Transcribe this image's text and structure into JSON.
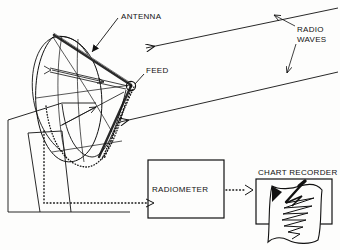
{
  "figure": {
    "type": "technical-diagram",
    "background_color": "#fdfdfc",
    "ink_color": "#111111"
  },
  "labels": {
    "antenna": "ANTENNA",
    "feed": "FEED",
    "radio_waves_line1": "RADIO",
    "radio_waves_line2": "WAVES",
    "radiometer": "RADIOMETER",
    "chart_recorder": "CHART RECORDER"
  },
  "components": {
    "antenna": {
      "name": "parabolic-dish-antenna",
      "description": "elliptical parabolic reflector dish on pedestal mount"
    },
    "feed": {
      "name": "feed-horn",
      "description": "receiver at the focal point of the dish"
    },
    "pedestal": {
      "name": "antenna-pedestal",
      "description": "tapered support base for the dish"
    },
    "radio_waves": {
      "name": "incoming-radio-waves",
      "description": "two parallel rays arriving from upper right travelling left",
      "ray_count": 2,
      "direction": "right-to-left"
    },
    "reflected_rays": {
      "name": "reflected-rays",
      "description": "rays reflected off dish surface converging on the feed",
      "ray_count": 3
    },
    "signal_path": {
      "name": "signal-cable-path",
      "style": "dotted",
      "description": "dotted line from feed down through pedestal to radiometer, then radiometer to chart recorder"
    },
    "radiometer": {
      "name": "radiometer-box",
      "shape": "rectangle"
    },
    "chart_recorder": {
      "name": "chart-recorder",
      "description": "pen plotting a zigzag trace on fan-fold chart paper"
    }
  },
  "colors": {
    "ink": "#111111",
    "paper": "#fdfdfc",
    "dish_rim": "#2a2a2a"
  }
}
